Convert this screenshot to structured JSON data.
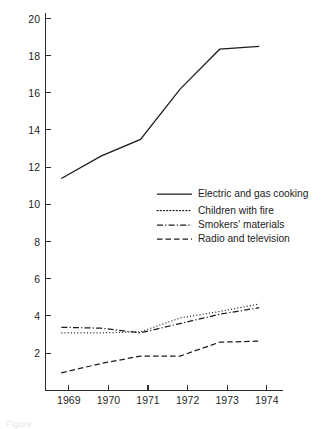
{
  "figure": {
    "background_color": "#ffffff",
    "ink_color": "#1c1c1c",
    "caption_fragment": "Figure"
  },
  "chart_data": {
    "type": "line",
    "title": "",
    "subtitle": "",
    "xlabel": "",
    "ylabel": "",
    "x": [
      1969,
      1970,
      1971,
      1972,
      1973,
      1974
    ],
    "categories": [
      "1969",
      "1970",
      "1971",
      "1972",
      "1973",
      "1974"
    ],
    "xlim": [
      1968.6,
      1974.6
    ],
    "ylim": [
      0,
      20
    ],
    "y_ticks": [
      2,
      4,
      6,
      8,
      10,
      12,
      14,
      16,
      18,
      20
    ],
    "y_tick_labels": [
      "2",
      "4",
      "6",
      "8",
      "10",
      "12",
      "14",
      "16",
      "18",
      "20"
    ],
    "x_ticks": [
      1969,
      1970,
      1971,
      1972,
      1973,
      1974
    ],
    "x_tick_labels": [
      "1969",
      "1970",
      "1971",
      "1972",
      "1973",
      "1974"
    ],
    "grid": false,
    "legend_position": "inside-center-right",
    "series": [
      {
        "name": "Electric and gas cooking",
        "style": "solid",
        "dasharray": "none",
        "color": "#1c1c1c",
        "values": [
          11.4,
          12.6,
          13.5,
          16.2,
          18.35,
          18.5
        ]
      },
      {
        "name": "Children with fire",
        "style": "dotted",
        "dasharray": "1,2.2",
        "color": "#1c1c1c",
        "values": [
          3.1,
          3.1,
          3.15,
          3.9,
          4.25,
          4.65
        ]
      },
      {
        "name": "Smokers' materials",
        "style": "dash-dot",
        "dasharray": "6,2.2,1.2,2.2",
        "color": "#1c1c1c",
        "values": [
          3.4,
          3.35,
          3.1,
          3.6,
          4.1,
          4.45
        ]
      },
      {
        "name": "Radio and television",
        "style": "dashed",
        "dasharray": "5.5,3",
        "color": "#1c1c1c",
        "values": [
          0.95,
          1.45,
          1.85,
          1.85,
          2.6,
          2.65
        ]
      }
    ],
    "legend": [
      {
        "label": "Electric and gas cooking",
        "dasharray": "none"
      },
      {
        "label": "Children with fire",
        "dasharray": "1,2.2"
      },
      {
        "label": "Smokers' materials",
        "dasharray": "6,2.2,1.2,2.2"
      },
      {
        "label": "Radio and television",
        "dasharray": "5.5,3"
      }
    ]
  }
}
